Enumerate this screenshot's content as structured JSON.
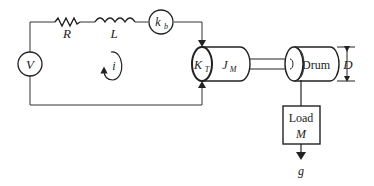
{
  "diagram": {
    "circuit": {
      "source_label": "V",
      "resistor_label": "R",
      "inductor_label": "L",
      "back_emf_label_main": "k",
      "back_emf_label_sub": "b",
      "current_label": "i"
    },
    "motor": {
      "torque_const_main": "K",
      "torque_const_sub": "T",
      "inertia_main": "J",
      "inertia_sub": "M"
    },
    "drum": {
      "label": "Drum",
      "diameter_label": "D"
    },
    "load": {
      "label_line1": "Load",
      "label_line2": "M",
      "gravity_label": "g"
    }
  }
}
